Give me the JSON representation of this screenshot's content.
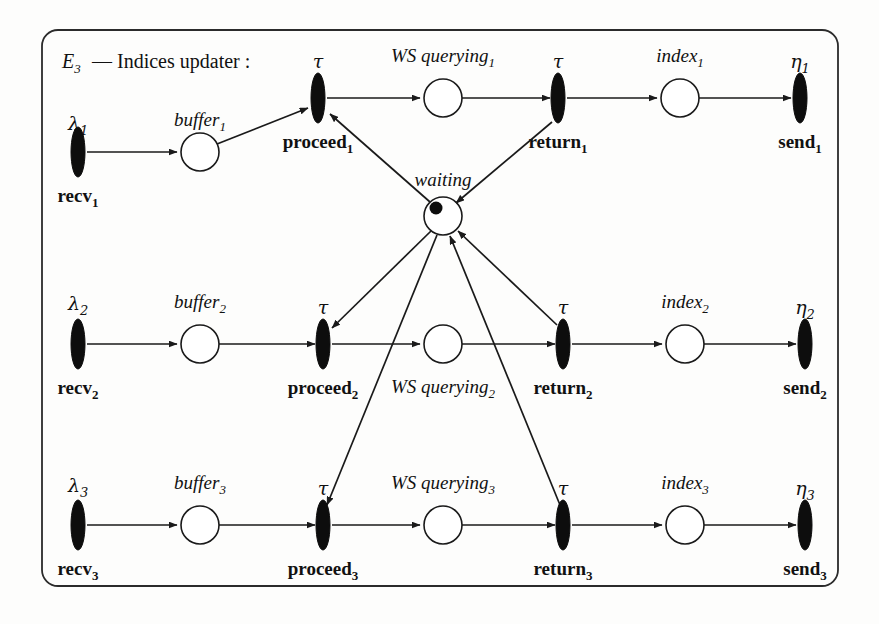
{
  "figure": {
    "title_main": "E",
    "title_sub": "3",
    "title_rest": "— Indices updater :",
    "type": "petri-net",
    "frame": {
      "x": 42,
      "y": 30,
      "width": 796,
      "height": 556,
      "radius": 16
    }
  },
  "net": {
    "token_count": 1,
    "shared_place": {
      "id": "waiting",
      "label": "waiting",
      "cx": 443,
      "cy": 216,
      "r": 19,
      "tokens": 1
    },
    "rows": [
      {
        "index": "1",
        "y_main": 98,
        "y_proceed": 98,
        "lambda_label": "λ",
        "lambda_sub": "1",
        "recv_label": "recv",
        "recv_sub": "1",
        "recv_x": 78,
        "buffer_label": "buffer",
        "buffer_sub": "1",
        "buffer_x": 200,
        "buffer_y": 152,
        "proceed_tau": "τ",
        "proceed_label": "proceed",
        "proceed_sub": "1",
        "proceed_x": 318,
        "proceed_y": 98,
        "querying_label": "WS querying",
        "querying_sub": "1",
        "querying_x": 443,
        "querying_y": 98,
        "querying_label_above": true,
        "return_tau": "τ",
        "return_label": "return",
        "return_sub": "1",
        "return_x": 558,
        "return_y": 98,
        "index_label": "index",
        "index_sub": "1",
        "index_x": 680,
        "index_y": 98,
        "eta_label": "η",
        "eta_sub": "1",
        "send_label": "send",
        "send_sub": "1",
        "send_x": 800,
        "send_y": 98,
        "recv_y": 152
      },
      {
        "index": "2",
        "y_main": 344,
        "y_proceed": 344,
        "lambda_label": "λ",
        "lambda_sub": "2",
        "recv_label": "recv",
        "recv_sub": "2",
        "recv_x": 78,
        "buffer_label": "buffer",
        "buffer_sub": "2",
        "buffer_x": 200,
        "buffer_y": 344,
        "proceed_tau": "τ",
        "proceed_label": "proceed",
        "proceed_sub": "2",
        "proceed_x": 323,
        "proceed_y": 344,
        "querying_label": "WS querying",
        "querying_sub": "2",
        "querying_x": 443,
        "querying_y": 344,
        "querying_label_above": false,
        "return_tau": "τ",
        "return_label": "return",
        "return_sub": "2",
        "return_x": 563,
        "return_y": 344,
        "index_label": "index",
        "index_sub": "2",
        "index_x": 685,
        "index_y": 344,
        "eta_label": "η",
        "eta_sub": "2",
        "send_label": "send",
        "send_sub": "2",
        "send_x": 805,
        "send_y": 344,
        "recv_y": 344
      },
      {
        "index": "3",
        "y_main": 525,
        "y_proceed": 525,
        "lambda_label": "λ",
        "lambda_sub": "3",
        "recv_label": "recv",
        "recv_sub": "3",
        "recv_x": 78,
        "buffer_label": "buffer",
        "buffer_sub": "3",
        "buffer_x": 200,
        "buffer_y": 525,
        "proceed_tau": "τ",
        "proceed_label": "proceed",
        "proceed_sub": "3",
        "proceed_x": 323,
        "proceed_y": 525,
        "querying_label": "WS querying",
        "querying_sub": "3",
        "querying_x": 443,
        "querying_y": 525,
        "querying_label_above": true,
        "return_tau": "τ",
        "return_label": "return",
        "return_sub": "3",
        "return_x": 563,
        "return_y": 525,
        "index_label": "index",
        "index_sub": "3",
        "index_x": 685,
        "index_y": 525,
        "eta_label": "η",
        "eta_sub": "3",
        "send_label": "send",
        "send_sub": "3",
        "send_x": 805,
        "send_y": 525,
        "recv_y": 525
      }
    ]
  },
  "colors": {
    "ink": "#111111",
    "paper": "#fdfdfc",
    "frame": "#2b2b2b"
  }
}
